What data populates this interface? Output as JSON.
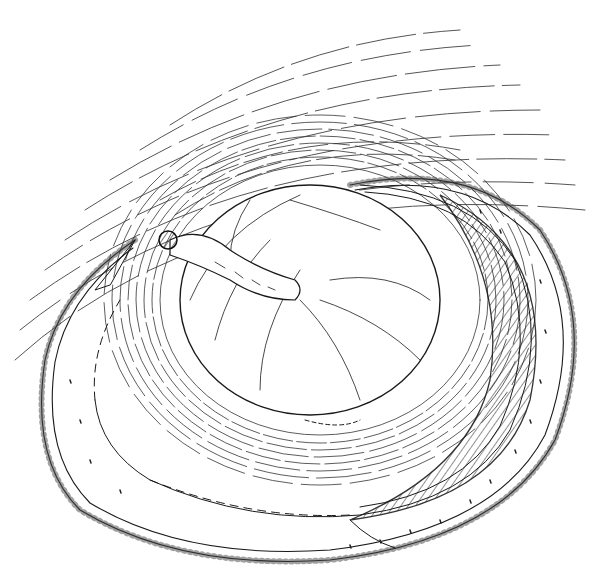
{
  "figure": {
    "type": "scientific line illustration",
    "background": "#ffffff",
    "ink_color": "#1a1a1a",
    "labels": []
  }
}
